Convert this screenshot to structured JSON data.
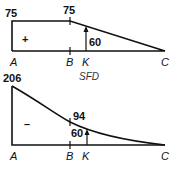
{
  "sfd": {
    "title": "SFD",
    "sign": "+",
    "value_A": "75",
    "value_B": "75",
    "value_K": "60",
    "points": [
      "A",
      "B",
      "K",
      "C"
    ]
  },
  "bmd": {
    "sign": "–",
    "value_A": "206",
    "value_B": "94",
    "value_K": "60",
    "points": [
      "A",
      "B",
      "K",
      "C"
    ]
  },
  "colors": {
    "line": "#111111",
    "background": "#ffffff"
  }
}
